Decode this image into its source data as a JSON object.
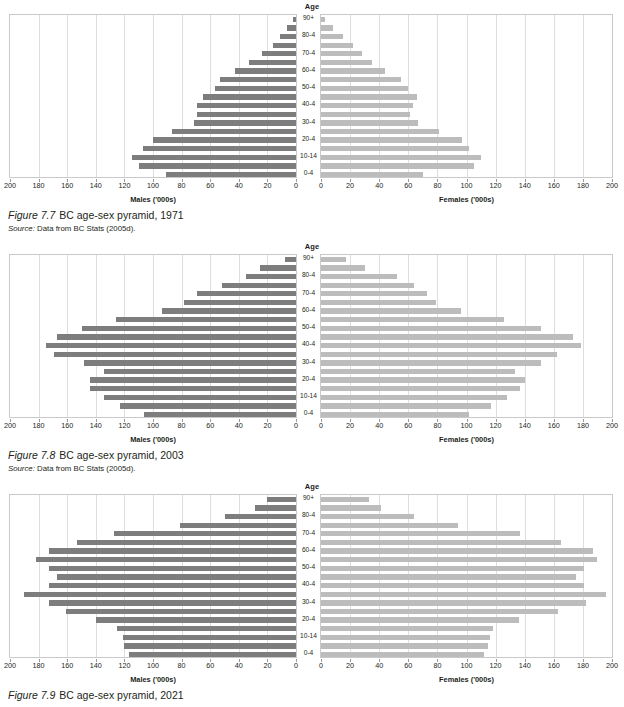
{
  "page": {
    "axis_header": "Age",
    "male_axis_title": "Males ('000s)",
    "female_axis_title": "Females ('000s)",
    "male_ticks": [
      200,
      180,
      160,
      140,
      120,
      100,
      80,
      60,
      40,
      20,
      0
    ],
    "female_ticks": [
      0,
      20,
      40,
      60,
      80,
      100,
      120,
      140,
      160,
      180,
      200
    ],
    "age_groups": [
      "90+",
      "85-9",
      "80-4",
      "75-9",
      "70-4",
      "65-9",
      "60-4",
      "55-9",
      "50-4",
      "45-9",
      "40-4",
      "35-9",
      "30-4",
      "25-9",
      "20-4",
      "15-9",
      "10-14",
      "5-9",
      "0-4"
    ],
    "age_labels_shown": [
      "90+",
      "",
      "80-4",
      "",
      "70-4",
      "",
      "60-4",
      "",
      "50-4",
      "",
      "40-4",
      "",
      "30-4",
      "",
      "20-4",
      "",
      "10-14",
      "",
      "0-4"
    ],
    "colors": {
      "male_bar": "#7d7d7d",
      "female_bar": "#bcbcbc",
      "gridline": "#dedede",
      "frame": "#c9c9c9",
      "text": "#231f20"
    }
  },
  "figures": [
    {
      "number": "Figure 7.7",
      "title": "BC age-sex pyramid, 1971",
      "source_lead": "Source:",
      "source_text": "Data from BC Stats (2005d).",
      "has_source": true
    },
    {
      "number": "Figure 7.8",
      "title": "BC age-sex pyramid, 2003",
      "source_lead": "Source:",
      "source_text": "Data from BC Stats (2005d).",
      "has_source": true
    },
    {
      "number": "Figure 7.9",
      "title": "BC age-sex pyramid, 2021",
      "source_lead": "",
      "source_text": "",
      "has_source": false
    }
  ],
  "chart_data": [
    {
      "type": "bar",
      "title": "BC age-sex pyramid, 1971",
      "subtitle": "Figure 7.7",
      "orientation": "horizontal",
      "layout": "population-pyramid",
      "xlabel_left": "Males ('000s)",
      "xlabel_right": "Females ('000s)",
      "ylabel": "Age",
      "xlim": [
        0,
        200
      ],
      "grid": true,
      "legend": "none",
      "categories": [
        "90+",
        "85-9",
        "80-4",
        "75-9",
        "70-4",
        "65-9",
        "60-4",
        "55-9",
        "50-4",
        "45-9",
        "40-4",
        "35-9",
        "30-4",
        "25-9",
        "20-4",
        "15-9",
        "10-14",
        "5-9",
        "0-4"
      ],
      "series": [
        {
          "name": "Males ('000s)",
          "side": "left",
          "values": [
            2,
            6,
            11,
            16,
            24,
            33,
            43,
            53,
            57,
            65,
            69,
            69,
            71,
            87,
            100,
            107,
            115,
            110,
            91
          ]
        },
        {
          "name": "Females ('000s)",
          "side": "right",
          "values": [
            3,
            8,
            15,
            22,
            28,
            35,
            44,
            55,
            60,
            66,
            63,
            61,
            67,
            81,
            97,
            102,
            110,
            105,
            70
          ]
        }
      ]
    },
    {
      "type": "bar",
      "title": "BC age-sex pyramid, 2003",
      "subtitle": "Figure 7.8",
      "orientation": "horizontal",
      "layout": "population-pyramid",
      "xlabel_left": "Males ('000s)",
      "xlabel_right": "Females ('000s)",
      "ylabel": "Age",
      "xlim": [
        0,
        200
      ],
      "grid": true,
      "legend": "none",
      "categories": [
        "90+",
        "85-9",
        "80-4",
        "75-9",
        "70-4",
        "65-9",
        "60-4",
        "55-9",
        "50-4",
        "45-9",
        "40-4",
        "35-9",
        "30-4",
        "25-9",
        "20-4",
        "15-9",
        "10-14",
        "5-9",
        "0-4"
      ],
      "series": [
        {
          "name": "Males ('000s)",
          "side": "left",
          "values": [
            8,
            25,
            35,
            52,
            69,
            78,
            94,
            126,
            150,
            167,
            175,
            169,
            148,
            134,
            144,
            144,
            134,
            123,
            106
          ]
        },
        {
          "name": "Females ('000s)",
          "side": "right",
          "values": [
            17,
            30,
            52,
            64,
            73,
            79,
            96,
            126,
            151,
            173,
            179,
            162,
            151,
            133,
            140,
            137,
            128,
            117,
            102
          ]
        }
      ]
    },
    {
      "type": "bar",
      "title": "BC age-sex pyramid, 2021",
      "subtitle": "Figure 7.9",
      "orientation": "horizontal",
      "layout": "population-pyramid",
      "xlabel_left": "Males ('000s)",
      "xlabel_right": "Females ('000s)",
      "ylabel": "Age",
      "xlim": [
        0,
        200
      ],
      "grid": true,
      "legend": "none",
      "categories": [
        "90+",
        "85-9",
        "80-4",
        "75-9",
        "70-4",
        "65-9",
        "60-4",
        "55-9",
        "50-4",
        "45-9",
        "40-4",
        "35-9",
        "30-4",
        "25-9",
        "20-4",
        "15-9",
        "10-14",
        "5-9",
        "0-4"
      ],
      "series": [
        {
          "name": "Males ('000s)",
          "side": "left",
          "values": [
            20,
            29,
            50,
            81,
            127,
            153,
            173,
            182,
            173,
            167,
            173,
            190,
            173,
            161,
            140,
            125,
            121,
            120,
            117
          ]
        },
        {
          "name": "Females ('000s)",
          "side": "right",
          "values": [
            33,
            41,
            64,
            94,
            137,
            165,
            187,
            190,
            181,
            175,
            181,
            196,
            182,
            163,
            136,
            118,
            116,
            115,
            112
          ]
        }
      ]
    }
  ]
}
